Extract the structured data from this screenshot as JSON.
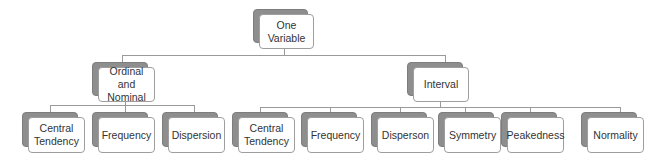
{
  "diagram": {
    "root": {
      "label_line1": "One",
      "label_line2": "Variable"
    },
    "branches": [
      {
        "label_line1": "Ordinal and",
        "label_line2": "Nominal",
        "children": [
          {
            "label_line1": "Central",
            "label_line2": "Tendency"
          },
          {
            "label_line1": "Frequency",
            "label_line2": ""
          },
          {
            "label_line1": "Dispersion",
            "label_line2": ""
          }
        ]
      },
      {
        "label_line1": "Interval",
        "label_line2": "",
        "children": [
          {
            "label_line1": "Central",
            "label_line2": "Tendency"
          },
          {
            "label_line1": "Frequency",
            "label_line2": ""
          },
          {
            "label_line1": "Disperson",
            "label_line2": ""
          },
          {
            "label_line1": "Symmetry",
            "label_line2": ""
          },
          {
            "label_line1": "Peakedness",
            "label_line2": ""
          },
          {
            "label_line1": "Normality",
            "label_line2": ""
          }
        ]
      }
    ]
  }
}
